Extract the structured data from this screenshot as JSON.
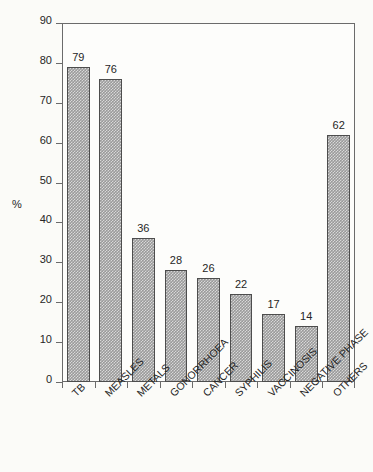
{
  "chart_data": {
    "type": "bar",
    "title": "",
    "subtitle": "",
    "xlabel": "",
    "ylabel": "%",
    "ylim": [
      0,
      90
    ],
    "ytick_step": 10,
    "yticks": [
      0,
      10,
      20,
      30,
      40,
      50,
      60,
      70,
      80,
      90
    ],
    "grid": false,
    "legend": false,
    "categories": [
      "TB",
      "MEASLES",
      "METALS",
      "GONORRHOEA",
      "CANCER",
      "SYPHILIS",
      "VACCINOSIS",
      "NEGATIVE PHASE",
      "OTHERS"
    ],
    "values": [
      79,
      76,
      36,
      28,
      26,
      22,
      17,
      14,
      62
    ],
    "value_labels": [
      "79",
      "76",
      "36",
      "28",
      "26",
      "22",
      "17",
      "14",
      "62"
    ],
    "bar_color": "#9a9a9a",
    "bar_edge_color": "#4d4d4d",
    "axis_color": "#6b6b6b",
    "background_color": "#fbfbf8",
    "label_rotation_degrees": -45
  }
}
